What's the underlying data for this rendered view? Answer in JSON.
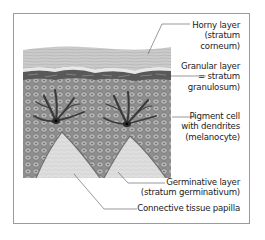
{
  "diagram": {
    "colors": {
      "frame": "#9a9a9a",
      "horny_layer": "#c9c9c9",
      "granular_layer": "#5a5a5a",
      "cell_layer": "#9d9d9d",
      "papilla": "#dcdcdc",
      "melanocyte": "#2e2e2e",
      "text": "#222222"
    },
    "labels": [
      {
        "id": "horny",
        "lines": [
          "Horny layer",
          "(stratum",
          "corneum)"
        ]
      },
      {
        "id": "granular",
        "lines": [
          "Granular layer",
          "= stratum",
          "granulosum)"
        ]
      },
      {
        "id": "pigment",
        "lines": [
          "Pigment cell",
          "with dendrites",
          "(melanocyte)"
        ]
      },
      {
        "id": "germinative",
        "lines": [
          "Germinative layer",
          "(stratum germinativum)"
        ]
      },
      {
        "id": "papilla",
        "lines": [
          "Connective tissue papilla"
        ]
      }
    ]
  }
}
